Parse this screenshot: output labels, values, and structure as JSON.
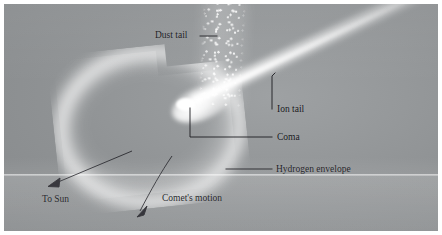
{
  "figure": {
    "background_color": "#8e9193",
    "label_color": "#16161a",
    "glow_color": "#ffffff"
  },
  "labels": {
    "dust_tail": "Dust tail",
    "ion_tail": "Ion tail",
    "coma": "Coma",
    "hydrogen_envelope": "Hydrogen envelope",
    "to_sun": "To Sun",
    "comets_motion": "Comet's motion"
  },
  "features": [
    {
      "name": "dust-tail",
      "label": "Dust tail",
      "description": "speckled band of dust particles trailing upward from the nucleus"
    },
    {
      "name": "ion-tail",
      "label": "Ion tail",
      "description": "straight bright beam of ionized gas pointing away from the Sun to the upper right"
    },
    {
      "name": "coma",
      "label": "Coma",
      "description": "bright glowing cloud of gas and dust surrounding the nucleus"
    },
    {
      "name": "hydrogen-envelope",
      "label": "Hydrogen envelope",
      "description": "large faint crescent-shaped hydrogen cloud enclosing the coma"
    },
    {
      "name": "to-sun",
      "label": "To Sun",
      "description": "arrow toward the lower left indicating the direction of the Sun"
    },
    {
      "name": "comets-motion",
      "label": "Comet's motion",
      "description": "curved arrow toward the lower left indicating the comet's direction of travel"
    }
  ]
}
